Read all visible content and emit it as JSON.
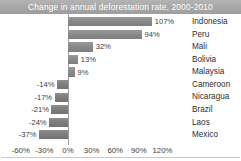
{
  "chart_data": {
    "type": "bar",
    "orientation": "horizontal",
    "title": "Change in annual deforestation rate, 2000-2010",
    "xlabel": "",
    "ylabel": "",
    "xlim": [
      -60,
      120
    ],
    "xticks": [
      -60,
      -30,
      0,
      30,
      60,
      90,
      120
    ],
    "xtick_labels": [
      "-60%",
      "-30%",
      "0%",
      "30%",
      "60%",
      "90%",
      "120%"
    ],
    "grid": false,
    "legend": false,
    "value_suffix": "%",
    "categories": [
      "Indonesia",
      "Peru",
      "Mali",
      "Bolivia",
      "Malaysia",
      "Cameroon",
      "Nicaragua",
      "Brazil",
      "Laos",
      "Mexico"
    ],
    "values": [
      107,
      94,
      32,
      13,
      9,
      -14,
      -17,
      -21,
      -24,
      -37
    ],
    "value_labels": [
      "107%",
      "94%",
      "32%",
      "13%",
      "9%",
      "-14%",
      "-17%",
      "-21%",
      "-24%",
      "-37%"
    ],
    "bars": [
      {
        "category": "Indonesia",
        "value": 107,
        "value_label": "107%"
      },
      {
        "category": "Peru",
        "value": 94,
        "value_label": "94%"
      },
      {
        "category": "Mali",
        "value": 32,
        "value_label": "32%"
      },
      {
        "category": "Bolivia",
        "value": 13,
        "value_label": "13%"
      },
      {
        "category": "Malaysia",
        "value": 9,
        "value_label": "9%"
      },
      {
        "category": "Cameroon",
        "value": -14,
        "value_label": "-14%"
      },
      {
        "category": "Nicaragua",
        "value": -17,
        "value_label": "-17%"
      },
      {
        "category": "Brazil",
        "value": -21,
        "value_label": "-21%"
      },
      {
        "category": "Laos",
        "value": -24,
        "value_label": "-24%"
      },
      {
        "category": "Mexico",
        "value": -37,
        "value_label": "-37%"
      }
    ],
    "colors": {
      "bar": "#8a8a8a",
      "title_band": "#a6a6a6",
      "title_text": "#ffffff",
      "axis_line": "#9a9a9a",
      "tick_text": "#3d3d3d",
      "category_text": "#2e2e2e",
      "background": "#ffffff"
    }
  }
}
